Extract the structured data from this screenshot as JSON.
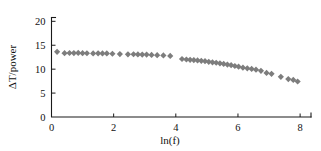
{
  "chart_data": {
    "type": "scatter",
    "title": "",
    "subtitle": "",
    "xlabel": "ln(f)",
    "ylabel": "ΔT/power",
    "xlim": [
      0,
      8.35
    ],
    "ylim": [
      0,
      20.8
    ],
    "xticks": [
      0,
      2,
      4,
      6,
      8
    ],
    "xtick_labels": [
      "0",
      "2",
      "4",
      "6",
      "8"
    ],
    "yticks": [
      0,
      5,
      10,
      15,
      20
    ],
    "ytick_labels": [
      "0",
      "5",
      "10",
      "15",
      "20"
    ],
    "grid": false,
    "legend": null,
    "legend_position": "none",
    "annotations": [],
    "marker": {
      "shape": "diamond",
      "color": "#7d7d7d",
      "size": 3.1
    },
    "series": [
      {
        "name": "ΔT/power vs ln(f)",
        "color": "#7d7d7d",
        "points": [
          [
            0.18,
            13.62
          ],
          [
            0.42,
            13.35
          ],
          [
            0.58,
            13.38
          ],
          [
            0.72,
            13.36
          ],
          [
            0.86,
            13.4
          ],
          [
            1.0,
            13.34
          ],
          [
            1.14,
            13.33
          ],
          [
            1.34,
            13.3
          ],
          [
            1.5,
            13.32
          ],
          [
            1.64,
            13.28
          ],
          [
            1.78,
            13.3
          ],
          [
            1.96,
            13.22
          ],
          [
            2.2,
            13.16
          ],
          [
            2.46,
            13.1
          ],
          [
            2.64,
            13.12
          ],
          [
            2.78,
            13.08
          ],
          [
            2.92,
            13.06
          ],
          [
            3.06,
            13.04
          ],
          [
            3.22,
            12.98
          ],
          [
            3.4,
            12.92
          ],
          [
            3.6,
            12.88
          ],
          [
            3.82,
            12.76
          ],
          [
            4.2,
            12.12
          ],
          [
            4.34,
            12.02
          ],
          [
            4.46,
            11.96
          ],
          [
            4.58,
            11.9
          ],
          [
            4.7,
            11.82
          ],
          [
            4.82,
            11.74
          ],
          [
            4.94,
            11.66
          ],
          [
            5.06,
            11.54
          ],
          [
            5.18,
            11.44
          ],
          [
            5.3,
            11.34
          ],
          [
            5.42,
            11.22
          ],
          [
            5.54,
            11.1
          ],
          [
            5.66,
            10.96
          ],
          [
            5.78,
            10.84
          ],
          [
            5.9,
            10.66
          ],
          [
            6.02,
            10.52
          ],
          [
            6.16,
            10.32
          ],
          [
            6.3,
            10.18
          ],
          [
            6.44,
            10.06
          ],
          [
            6.58,
            9.9
          ],
          [
            6.74,
            9.66
          ],
          [
            6.92,
            9.22
          ],
          [
            7.08,
            9.02
          ],
          [
            7.38,
            8.4
          ],
          [
            7.62,
            7.92
          ],
          [
            7.78,
            7.74
          ],
          [
            7.92,
            7.42
          ]
        ]
      }
    ]
  }
}
